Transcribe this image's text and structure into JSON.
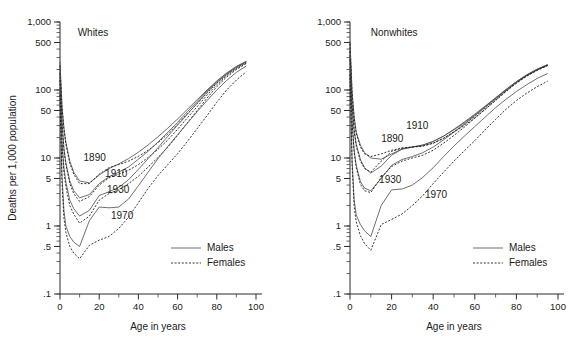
{
  "figure": {
    "ylabel": "Deaths per 1,000 population",
    "xlabel_left": "Age in years",
    "xlabel_right": "Age in years",
    "colors": {
      "males": "#555555",
      "females": "#111111",
      "axis": "#2b2b2b"
    }
  },
  "legend": {
    "males_label": "Males",
    "females_label": "Females",
    "males_style": "solid",
    "females_style": "dotted"
  },
  "chart_data": [
    {
      "type": "line",
      "title": "Whites",
      "xlabel": "Age in years",
      "ylabel": "Deaths per 1,000 population",
      "yscale": "log",
      "ylim": [
        0.1,
        1000
      ],
      "xlim": [
        0,
        100
      ],
      "ytick_labels": [
        "1,000",
        "500",
        "100",
        "50",
        "10",
        "5",
        "1",
        ".5",
        ".1"
      ],
      "ytick_values": [
        1000,
        500,
        100,
        50,
        10,
        5,
        1,
        0.5,
        0.1
      ],
      "xtick_labels": [
        "0",
        "20",
        "40",
        "60",
        "80",
        "100"
      ],
      "xtick_values": [
        0,
        20,
        40,
        60,
        80,
        100
      ],
      "grid": false,
      "legend_position": "lower-right",
      "annotations": [
        {
          "text": "Whites",
          "x": 9,
          "y": 620
        },
        {
          "text": "1890",
          "x": 12,
          "y": 9.0
        },
        {
          "text": "1910",
          "x": 23,
          "y": 5.2
        },
        {
          "text": "1930",
          "x": 24,
          "y": 3.1
        },
        {
          "text": "1970",
          "x": 26,
          "y": 1.25
        }
      ],
      "series": [
        {
          "name": "1890 Males",
          "year": 1890,
          "sex": "Males",
          "style": "solid",
          "x": [
            0,
            1,
            2,
            3,
            5,
            7,
            10,
            15,
            20,
            25,
            30,
            35,
            40,
            45,
            50,
            55,
            60,
            65,
            70,
            75,
            80,
            85,
            90,
            95
          ],
          "y": [
            260,
            60,
            28,
            17,
            9.0,
            6.2,
            4.6,
            4.3,
            5.6,
            7.0,
            8.2,
            9.8,
            12.2,
            15.6,
            20.5,
            27.5,
            37.5,
            52,
            72,
            100,
            136,
            178,
            222,
            265
          ]
        },
        {
          "name": "1890 Females",
          "year": 1890,
          "sex": "Females",
          "style": "dotted",
          "x": [
            0,
            1,
            2,
            3,
            5,
            7,
            10,
            15,
            20,
            25,
            30,
            35,
            40,
            45,
            50,
            55,
            60,
            65,
            70,
            75,
            80,
            85,
            90,
            95
          ],
          "y": [
            230,
            55,
            26,
            16,
            8.4,
            5.8,
            4.2,
            4.2,
            5.8,
            7.2,
            8.0,
            9.0,
            10.6,
            13.0,
            16.8,
            22.5,
            31.5,
            45,
            63,
            90,
            126,
            168,
            212,
            255
          ]
        },
        {
          "name": "1910 Males",
          "year": 1910,
          "sex": "Males",
          "style": "solid",
          "x": [
            0,
            1,
            2,
            3,
            5,
            7,
            10,
            15,
            20,
            25,
            30,
            35,
            40,
            45,
            50,
            55,
            60,
            65,
            70,
            75,
            80,
            85,
            90,
            95
          ],
          "y": [
            210,
            36,
            14,
            8.5,
            4.6,
            3.3,
            2.6,
            2.9,
            4.2,
            5.3,
            6.2,
            7.4,
            9.6,
            12.6,
            17.2,
            23.8,
            33.5,
            48,
            68,
            97,
            133,
            175,
            220,
            262
          ]
        },
        {
          "name": "1910 Females",
          "year": 1910,
          "sex": "Females",
          "style": "dotted",
          "x": [
            0,
            1,
            2,
            3,
            5,
            7,
            10,
            15,
            20,
            25,
            30,
            35,
            40,
            45,
            50,
            55,
            60,
            65,
            70,
            75,
            80,
            85,
            90,
            95
          ],
          "y": [
            175,
            32,
            13,
            8.0,
            4.2,
            3.0,
            2.3,
            2.7,
            4.0,
            5.1,
            5.8,
            6.6,
            8.0,
            10.2,
            13.4,
            18.4,
            26.5,
            39,
            57,
            84,
            120,
            162,
            206,
            250
          ]
        },
        {
          "name": "1930 Males",
          "year": 1930,
          "sex": "Males",
          "style": "solid",
          "x": [
            0,
            1,
            2,
            3,
            5,
            7,
            10,
            15,
            20,
            25,
            30,
            35,
            40,
            45,
            50,
            55,
            60,
            65,
            70,
            75,
            80,
            85,
            90,
            95
          ],
          "y": [
            180,
            18,
            7.2,
            4.4,
            2.4,
            1.8,
            1.4,
            1.7,
            2.8,
            3.2,
            3.7,
            4.8,
            6.8,
            9.8,
            14.2,
            20.8,
            30.5,
            44,
            64,
            93,
            129,
            170,
            215,
            258
          ]
        },
        {
          "name": "1930 Females",
          "year": 1930,
          "sex": "Females",
          "style": "dotted",
          "x": [
            0,
            1,
            2,
            3,
            5,
            7,
            10,
            15,
            20,
            25,
            30,
            35,
            40,
            45,
            50,
            55,
            60,
            65,
            70,
            75,
            80,
            85,
            90,
            95
          ],
          "y": [
            140,
            15,
            6.2,
            3.8,
            2.0,
            1.5,
            1.1,
            1.4,
            2.4,
            3.0,
            3.4,
            4.2,
            5.4,
            7.4,
            10.2,
            14.4,
            21.5,
            33,
            50,
            76,
            112,
            155,
            200,
            245
          ]
        },
        {
          "name": "1970 Males",
          "year": 1970,
          "sex": "Males",
          "style": "solid",
          "x": [
            0,
            1,
            2,
            3,
            5,
            7,
            10,
            15,
            20,
            25,
            30,
            35,
            40,
            45,
            50,
            55,
            60,
            65,
            70,
            75,
            80,
            85,
            90,
            95
          ],
          "y": [
            110,
            5.6,
            1.7,
            1.0,
            0.7,
            0.58,
            0.5,
            1.2,
            1.9,
            1.85,
            1.9,
            2.5,
            3.9,
            6.2,
            9.8,
            14.8,
            22.0,
            32.5,
            48,
            70,
            100,
            138,
            182,
            225
          ]
        },
        {
          "name": "1970 Females",
          "year": 1970,
          "sex": "Females",
          "style": "dotted",
          "x": [
            0,
            1,
            2,
            3,
            5,
            7,
            10,
            15,
            20,
            25,
            30,
            35,
            40,
            45,
            50,
            55,
            60,
            65,
            70,
            75,
            80,
            85,
            90,
            95
          ],
          "y": [
            85,
            4.4,
            1.3,
            0.8,
            0.5,
            0.4,
            0.33,
            0.52,
            0.62,
            0.7,
            0.92,
            1.35,
            2.2,
            3.6,
            5.5,
            8.0,
            11.6,
            17.5,
            27,
            42,
            66,
            100,
            140,
            185
          ]
        }
      ]
    },
    {
      "type": "line",
      "title": "Nonwhites",
      "xlabel": "Age in years",
      "ylabel": "Deaths per 1,000 population",
      "yscale": "log",
      "ylim": [
        0.1,
        1000
      ],
      "xlim": [
        0,
        100
      ],
      "ytick_labels": [
        "1,000",
        "500",
        "100",
        "50",
        "10",
        "5",
        "1",
        ".5",
        ".1"
      ],
      "ytick_values": [
        1000,
        500,
        100,
        50,
        10,
        5,
        1,
        0.5,
        0.1
      ],
      "xtick_labels": [
        "0",
        "20",
        "40",
        "60",
        "80",
        "100"
      ],
      "xtick_values": [
        0,
        20,
        40,
        60,
        80,
        100
      ],
      "grid": false,
      "legend_position": "lower-right",
      "annotations": [
        {
          "text": "Nonwhites",
          "x": 10,
          "y": 620
        },
        {
          "text": "1890",
          "x": 15,
          "y": 17
        },
        {
          "text": "1910",
          "x": 27,
          "y": 27
        },
        {
          "text": "1930",
          "x": 14,
          "y": 4.3
        },
        {
          "text": "1970",
          "x": 36,
          "y": 2.6
        }
      ],
      "series": [
        {
          "name": "1890 Males",
          "year": 1890,
          "sex": "Males",
          "style": "solid",
          "x": [
            0,
            1,
            2,
            3,
            5,
            7,
            10,
            15,
            20,
            25,
            30,
            35,
            40,
            45,
            50,
            55,
            60,
            65,
            70,
            75,
            80,
            85,
            90,
            95
          ],
          "y": [
            520,
            95,
            40,
            24,
            15.5,
            12.0,
            10.0,
            9.6,
            11.5,
            13.5,
            14.5,
            15.5,
            17.5,
            21.0,
            26.0,
            33.0,
            43.0,
            57,
            76,
            101,
            132,
            166,
            200,
            232
          ]
        },
        {
          "name": "1890 Females",
          "year": 1890,
          "sex": "Females",
          "style": "dotted",
          "x": [
            0,
            1,
            2,
            3,
            5,
            7,
            10,
            15,
            20,
            25,
            30,
            35,
            40,
            45,
            50,
            55,
            60,
            65,
            70,
            75,
            80,
            85,
            90,
            95
          ],
          "y": [
            480,
            90,
            38,
            23,
            14.5,
            11.5,
            10.5,
            11.5,
            13.0,
            14.0,
            14.5,
            15.0,
            16.5,
            19.5,
            24.0,
            30.0,
            39.0,
            52,
            70,
            95,
            126,
            160,
            195,
            228
          ]
        },
        {
          "name": "1910 Males",
          "year": 1910,
          "sex": "Males",
          "style": "solid",
          "x": [
            0,
            1,
            2,
            3,
            5,
            7,
            10,
            15,
            20,
            25,
            30,
            35,
            40,
            45,
            50,
            55,
            60,
            65,
            70,
            75,
            80,
            85,
            90,
            95
          ],
          "y": [
            410,
            62,
            26,
            16,
            9.5,
            7.2,
            6.0,
            7.6,
            11.0,
            13.5,
            14.5,
            15.5,
            17.5,
            21.0,
            26.5,
            34.0,
            44.0,
            58,
            77,
            102,
            133,
            168,
            203,
            237
          ]
        },
        {
          "name": "1910 Females",
          "year": 1910,
          "sex": "Females",
          "style": "dotted",
          "x": [
            0,
            1,
            2,
            3,
            5,
            7,
            10,
            15,
            20,
            25,
            30,
            35,
            40,
            45,
            50,
            55,
            60,
            65,
            70,
            75,
            80,
            85,
            90,
            95
          ],
          "y": [
            370,
            58,
            25,
            15,
            9.0,
            7.0,
            6.2,
            9.0,
            12.5,
            14.0,
            14.5,
            15.0,
            16.5,
            19.5,
            24.5,
            31.5,
            41.0,
            55,
            73,
            98,
            129,
            163,
            198,
            232
          ]
        },
        {
          "name": "1930 Males",
          "year": 1930,
          "sex": "Males",
          "style": "solid",
          "x": [
            0,
            1,
            2,
            3,
            5,
            7,
            10,
            15,
            20,
            25,
            30,
            35,
            40,
            45,
            50,
            55,
            60,
            65,
            70,
            75,
            80,
            85,
            90,
            95
          ],
          "y": [
            330,
            35,
            13,
            7.8,
            4.5,
            3.6,
            3.3,
            5.0,
            7.8,
            9.5,
            10.5,
            12.0,
            14.5,
            18.5,
            24.0,
            31.5,
            42.0,
            56,
            75,
            100,
            131,
            166,
            201,
            235
          ]
        },
        {
          "name": "1930 Females",
          "year": 1930,
          "sex": "Females",
          "style": "dotted",
          "x": [
            0,
            1,
            2,
            3,
            5,
            7,
            10,
            15,
            20,
            25,
            30,
            35,
            40,
            45,
            50,
            55,
            60,
            65,
            70,
            75,
            80,
            85,
            90,
            95
          ],
          "y": [
            280,
            32,
            12,
            7.2,
            4.1,
            3.3,
            3.1,
            5.2,
            7.5,
            9.0,
            10.0,
            11.0,
            13.0,
            16.5,
            21.5,
            28.5,
            38.5,
            52,
            71,
            96,
            127,
            161,
            196,
            230
          ]
        },
        {
          "name": "1970 Males",
          "year": 1970,
          "sex": "Males",
          "style": "solid",
          "x": [
            0,
            1,
            2,
            3,
            5,
            7,
            10,
            15,
            20,
            25,
            30,
            35,
            40,
            45,
            50,
            55,
            60,
            65,
            70,
            75,
            80,
            85,
            90,
            95
          ],
          "y": [
            210,
            9.5,
            2.4,
            1.45,
            1.05,
            0.85,
            0.7,
            2.0,
            3.4,
            3.5,
            4.0,
            5.2,
            7.2,
            10.5,
            15.0,
            21.0,
            29.0,
            40,
            55,
            73,
            95,
            120,
            148,
            175
          ]
        },
        {
          "name": "1970 Females",
          "year": 1970,
          "sex": "Females",
          "style": "dotted",
          "x": [
            0,
            1,
            2,
            3,
            5,
            7,
            10,
            15,
            20,
            25,
            30,
            35,
            40,
            45,
            50,
            55,
            60,
            65,
            70,
            75,
            80,
            85,
            90,
            95
          ],
          "y": [
            170,
            7.8,
            1.9,
            1.15,
            0.72,
            0.55,
            0.44,
            1.05,
            1.25,
            1.5,
            2.0,
            2.8,
            4.2,
            6.2,
            9.0,
            12.8,
            18.0,
            26,
            37,
            52,
            70,
            90,
            112,
            135
          ]
        }
      ]
    }
  ]
}
